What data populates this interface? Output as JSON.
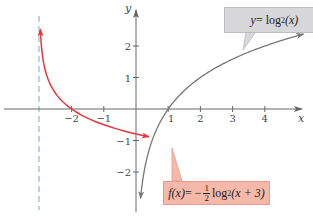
{
  "chart_data": {
    "type": "line",
    "title": "",
    "xlabel": "x",
    "ylabel": "y",
    "xlim": [
      -3.5,
      5
    ],
    "ylim": [
      -2.8,
      2.8
    ],
    "grid": false,
    "x_ticks": [
      -2,
      -1,
      1,
      2,
      3,
      4
    ],
    "x_tick_labels": [
      "−2",
      "−1",
      "1",
      "2",
      "3",
      "4"
    ],
    "y_ticks": [
      2,
      1,
      -1,
      -2
    ],
    "y_tick_labels": [
      "2",
      "1",
      "−1",
      "−2"
    ],
    "asymptote": {
      "x": -3,
      "style": "dashed",
      "color": "#7aaad6"
    },
    "series": [
      {
        "name": "y = log2(x)",
        "function": "log2(x)",
        "color": "#777777",
        "domain": [
          0.14,
          5.2
        ],
        "points": [
          [
            0.14,
            -2.84
          ],
          [
            0.25,
            -2
          ],
          [
            0.5,
            -1
          ],
          [
            1,
            0
          ],
          [
            2,
            1
          ],
          [
            4,
            2
          ],
          [
            5.2,
            2.38
          ]
        ]
      },
      {
        "name": "f(x) = -1/2 log2(x + 3)",
        "function": "-0.5*log2(x+3)",
        "color": "#e8383a",
        "domain": [
          -2.97,
          0.4
        ],
        "points": [
          [
            -2.97,
            2.53
          ],
          [
            -2.875,
            1.5
          ],
          [
            -2.75,
            1
          ],
          [
            -2.5,
            0.5
          ],
          [
            -2,
            0
          ],
          [
            -1,
            -0.5
          ],
          [
            0,
            -0.79
          ],
          [
            0.4,
            -0.88
          ]
        ]
      }
    ],
    "annotations": [
      {
        "text": "y = log2(x)",
        "box_color": "#d7d7d9",
        "points_to": "gray curve"
      },
      {
        "text": "f(x) = −1/2 log2(x + 3)",
        "box_color": "#f6b9a9",
        "points_to": "red curve"
      }
    ]
  },
  "labels": {
    "x_axis": "x",
    "y_axis": "y",
    "blue_label": {
      "lhs": "y",
      "eq": " = log",
      "sub": "2",
      "arg": "(x)"
    },
    "red_label": {
      "lhs": "f(x)",
      "eq": " = −",
      "num": "1",
      "den": "2",
      "log": " log",
      "sub": "2",
      "arg": "(x + 3)"
    }
  }
}
